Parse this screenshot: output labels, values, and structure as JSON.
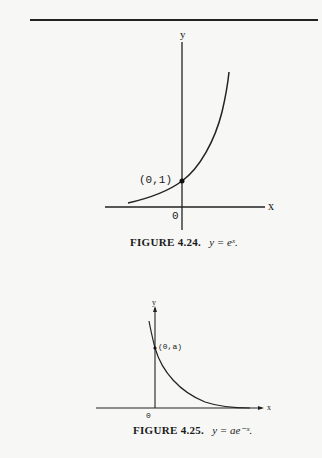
{
  "figure1": {
    "caption_label": "FIGURE 4.24.",
    "caption_eq": "y = eˣ.",
    "y_axis_label": "y",
    "x_axis_label": "x",
    "origin_label": "0",
    "point_label": "(0,1)"
  },
  "figure2": {
    "caption_label": "FIGURE 4.25.",
    "caption_eq": "y = ae⁻ˣ.",
    "y_axis_label": "y",
    "x_axis_label": "x",
    "origin_label": "0",
    "point_label": "(0,a)"
  }
}
